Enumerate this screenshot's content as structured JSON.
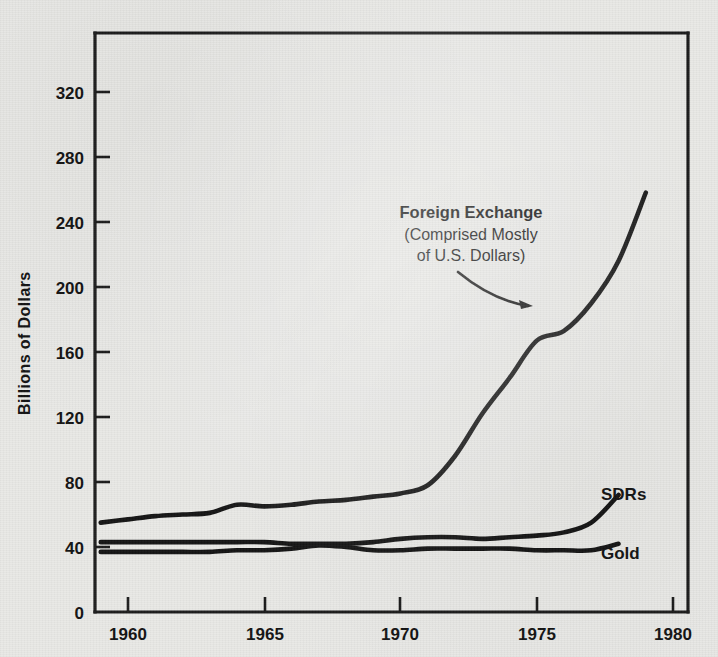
{
  "chart_data": {
    "type": "line",
    "title": "",
    "xlabel": "",
    "ylabel": "Billions of Dollars",
    "xlim": [
      1959,
      1981
    ],
    "ylim": [
      0,
      355
    ],
    "grid": false,
    "legend_position": "inline-right",
    "x_ticks": [
      1960,
      1965,
      1970,
      1975,
      1980
    ],
    "y_ticks": [
      0,
      40,
      80,
      120,
      160,
      200,
      240,
      280,
      320
    ],
    "annotations": [
      {
        "name": "foreign-exchange-callout",
        "line1": "Foreign Exchange",
        "line2": "(Comprised Mostly",
        "line3": "of U.S. Dollars)",
        "points_to_series": "Foreign Exchange",
        "points_to_x": 1976.2,
        "points_to_y": 190
      }
    ],
    "series": [
      {
        "name": "Foreign Exchange",
        "label": "Foreign Exchange",
        "label_inline": false,
        "color": "#141414",
        "x": [
          1959,
          1960,
          1961,
          1962,
          1963,
          1964,
          1965,
          1966,
          1967,
          1968,
          1969,
          1970,
          1971,
          1972,
          1973,
          1974,
          1975,
          1976,
          1977,
          1978,
          1979
        ],
        "values": [
          55,
          57,
          59,
          60,
          61,
          66,
          65,
          66,
          68,
          69,
          71,
          73,
          78,
          96,
          122,
          144,
          167,
          173,
          190,
          216,
          258
        ]
      },
      {
        "name": "SDRs",
        "label": "SDRs",
        "label_inline": true,
        "color": "#141414",
        "x": [
          1959,
          1960,
          1961,
          1962,
          1963,
          1964,
          1965,
          1966,
          1967,
          1968,
          1969,
          1970,
          1971,
          1972,
          1973,
          1974,
          1975,
          1976,
          1977,
          1978
        ],
        "values": [
          43,
          43,
          43,
          43,
          43,
          43,
          43,
          42,
          42,
          42,
          43,
          45,
          46,
          46,
          45,
          46,
          47,
          49,
          55,
          72
        ]
      },
      {
        "name": "Gold",
        "label": "Gold",
        "label_inline": true,
        "color": "#141414",
        "x": [
          1959,
          1960,
          1961,
          1962,
          1963,
          1964,
          1965,
          1966,
          1967,
          1968,
          1969,
          1970,
          1971,
          1972,
          1973,
          1974,
          1975,
          1976,
          1977,
          1978
        ],
        "values": [
          37,
          37,
          37,
          37,
          37,
          38,
          38,
          39,
          41,
          40,
          38,
          38,
          39,
          39,
          39,
          39,
          38,
          38,
          38,
          42
        ]
      }
    ]
  },
  "axes": {
    "y_axis_title": "Billions of Dollars",
    "y_tick_labels": [
      "320",
      "280",
      "240",
      "200",
      "160",
      "120",
      "80",
      "40",
      "0"
    ],
    "x_tick_labels": [
      "1960",
      "1965",
      "1970",
      "1975",
      "1980"
    ]
  },
  "labels": {
    "sdrs": "SDRs",
    "gold": "Gold",
    "fx_line1": "Foreign Exchange",
    "fx_line2": "(Comprised Mostly",
    "fx_line3": "of U.S. Dollars)"
  },
  "colors": {
    "background": "#e9e9e6",
    "ink": "#141414",
    "axis": "#1b1b1b"
  }
}
